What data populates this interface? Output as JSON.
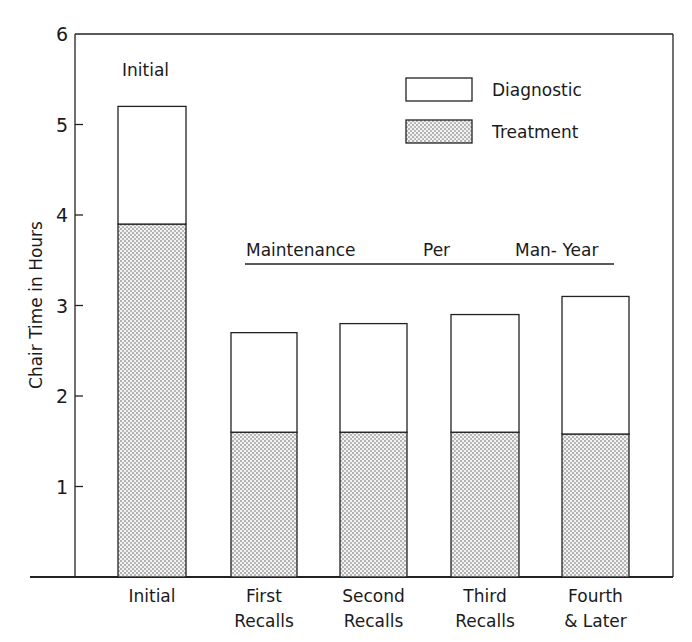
{
  "chart_data": {
    "type": "bar",
    "stacked": true,
    "title": "",
    "xlabel": "",
    "ylabel": "Chair Time in Hours",
    "ylim": [
      0,
      6
    ],
    "yticks": [
      "1",
      "2",
      "3",
      "4",
      "5",
      "6"
    ],
    "grid": false,
    "legend_position": "upper right",
    "categories": [
      "Initial",
      "First Recalls",
      "Second Recalls",
      "Third Recalls",
      "Fourth & Later"
    ],
    "category_lines": [
      [
        "Initial"
      ],
      [
        "First",
        "Recalls"
      ],
      [
        "Second",
        "Recalls"
      ],
      [
        "Third",
        "Recalls"
      ],
      [
        "Fourth",
        "& Later"
      ]
    ],
    "series": [
      {
        "name": "Treatment",
        "pattern": "stippled",
        "values": [
          3.9,
          1.6,
          1.6,
          1.6,
          1.58
        ]
      },
      {
        "name": "Diagnostic",
        "pattern": "white",
        "values": [
          1.3,
          1.1,
          1.2,
          1.3,
          1.52
        ]
      }
    ],
    "totals": [
      5.2,
      2.7,
      2.8,
      2.9,
      3.1
    ],
    "annotations": [
      {
        "text": "Initial",
        "position": "above first bar"
      },
      {
        "text_parts": [
          "Maintenance",
          "Per",
          "Man- Year"
        ],
        "position": "underlined bracket spanning recall bars"
      }
    ],
    "legend": [
      {
        "label": "Diagnostic",
        "pattern": "white"
      },
      {
        "label": "Treatment",
        "pattern": "stippled"
      }
    ]
  }
}
